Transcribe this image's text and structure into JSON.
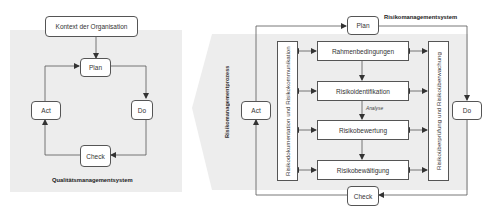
{
  "left_diagram": {
    "title": "Qualitätsmanagementsystem",
    "context_box": "Kontext der Organisation",
    "cycle": {
      "plan": "Plan",
      "do": "Do",
      "check": "Check",
      "act": "Act"
    }
  },
  "right_diagram": {
    "title": "Risikomanagementsystem",
    "process_label": "Risikomanagementprozess",
    "cycle": {
      "plan": "Plan",
      "do": "Do",
      "check": "Check",
      "act": "Act"
    },
    "process_steps": [
      "Rahmenbedingungen",
      "Risikoidentifikation",
      "Risikobewertung",
      "Risikobewältigung"
    ],
    "analysis_label": "Analyse",
    "left_side_box": "Risikodokumentation und Risikokommunikation",
    "right_side_box": "Risikoüberprüfung und Risikoüberwachung"
  },
  "colors": {
    "panel_gray": "#ececec",
    "line": "#555555",
    "box_fill": "#ffffff"
  }
}
